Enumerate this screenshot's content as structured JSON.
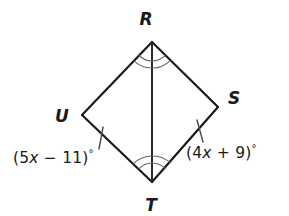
{
  "figure": {
    "kind": "kite-geometry-diagram",
    "background_color": "#ffffff",
    "stroke_color": "#1a1a1a",
    "mark_color": "#555555",
    "vertices": {
      "R": {
        "label": "R",
        "x": 152,
        "y": 42
      },
      "S": {
        "label": "S",
        "x": 218,
        "y": 107
      },
      "T": {
        "label": "T",
        "x": 152,
        "y": 182
      },
      "U": {
        "label": "U",
        "x": 82,
        "y": 115
      }
    },
    "vertex_label_positions": {
      "R": {
        "x": 146,
        "y": 25
      },
      "S": {
        "x": 231,
        "y": 104
      },
      "T": {
        "x": 146,
        "y": 210
      },
      "U": {
        "x": 58,
        "y": 122
      }
    },
    "sides": [
      {
        "name": "RU",
        "from": "R",
        "to": "U",
        "tick_marks": 0
      },
      {
        "name": "RS",
        "from": "R",
        "to": "S",
        "tick_marks": 0
      },
      {
        "name": "UT",
        "from": "U",
        "to": "T",
        "tick_marks": 1
      },
      {
        "name": "ST",
        "from": "S",
        "to": "T",
        "tick_marks": 1
      }
    ],
    "diagonal": {
      "name": "RT",
      "from": "R",
      "to": "T"
    },
    "angle_marks": [
      {
        "vertex": "R",
        "side": "left",
        "arcs": 2
      },
      {
        "vertex": "R",
        "side": "right",
        "arcs": 2
      },
      {
        "vertex": "T",
        "side": "left",
        "arcs": 2
      },
      {
        "vertex": "T",
        "side": "right",
        "arcs": 2
      }
    ],
    "angle_expressions": {
      "left": {
        "full_text": "(5x − 11)°",
        "open_paren": "(",
        "coefficient": "5",
        "variable": "x",
        "operator": "−",
        "constant": "11",
        "close_paren": ")",
        "degree_symbol": "°",
        "at_vertex": "U"
      },
      "right": {
        "full_text": "(4x + 9)°",
        "open_paren": "(",
        "coefficient": "4",
        "variable": "x",
        "operator": "+",
        "constant": "9",
        "close_paren": ")",
        "degree_symbol": "°",
        "at_vertex": "S"
      }
    }
  }
}
